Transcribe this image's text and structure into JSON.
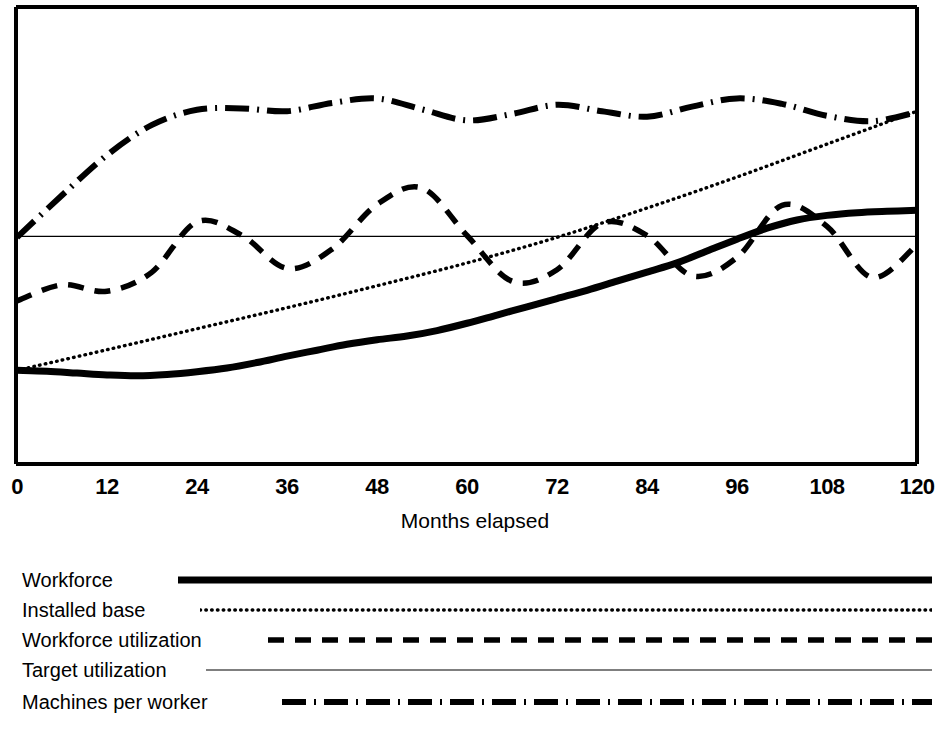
{
  "chart_data": {
    "type": "line",
    "title": "",
    "xlabel": "Months elapsed",
    "ylabel": "",
    "xlim": [
      0,
      120
    ],
    "ylim": [
      0,
      1
    ],
    "grid": false,
    "legend_position": "below",
    "x_ticks": [
      "0",
      "12",
      "24",
      "36",
      "48",
      "60",
      "72",
      "84",
      "96",
      "108",
      "120"
    ],
    "x_tick_values": [
      0,
      12,
      24,
      36,
      48,
      60,
      72,
      84,
      96,
      108,
      120
    ],
    "y_axis_labeled": false,
    "series": [
      {
        "name": "Workforce",
        "style": "thick-solid",
        "x": [
          0,
          4,
          8,
          12,
          16,
          20,
          24,
          28,
          32,
          36,
          40,
          44,
          48,
          52,
          56,
          60,
          64,
          68,
          72,
          76,
          80,
          84,
          88,
          92,
          96,
          100,
          104,
          108,
          112,
          116,
          120
        ],
        "values": [
          0.205,
          0.203,
          0.199,
          0.195,
          0.193,
          0.196,
          0.202,
          0.21,
          0.222,
          0.236,
          0.249,
          0.262,
          0.272,
          0.28,
          0.292,
          0.308,
          0.326,
          0.344,
          0.362,
          0.38,
          0.4,
          0.42,
          0.44,
          0.466,
          0.492,
          0.516,
          0.534,
          0.544,
          0.55,
          0.553,
          0.555
        ]
      },
      {
        "name": "Installed base",
        "style": "dotted",
        "x": [
          0,
          12,
          24,
          36,
          48,
          60,
          72,
          84,
          96,
          108,
          120
        ],
        "values": [
          0.205,
          0.25,
          0.296,
          0.342,
          0.39,
          0.44,
          0.496,
          0.56,
          0.628,
          0.7,
          0.772
        ]
      },
      {
        "name": "Workforce utilization",
        "style": "dashed",
        "x": [
          0,
          6,
          12,
          18,
          24,
          30,
          36,
          42,
          48,
          54,
          60,
          66,
          72,
          78,
          84,
          90,
          96,
          102,
          108,
          114,
          120
        ],
        "values": [
          0.357,
          0.392,
          0.378,
          0.42,
          0.53,
          0.5,
          0.428,
          0.47,
          0.568,
          0.604,
          0.5,
          0.4,
          0.425,
          0.527,
          0.5,
          0.412,
          0.452,
          0.566,
          0.52,
          0.408,
          0.48
        ]
      },
      {
        "name": "Target utilization",
        "style": "thin-solid",
        "x": [
          0,
          120
        ],
        "values": [
          0.498,
          0.498
        ]
      },
      {
        "name": "Machines per worker",
        "style": "dash-dot",
        "x": [
          0,
          6,
          12,
          18,
          24,
          30,
          36,
          42,
          48,
          54,
          60,
          66,
          72,
          78,
          84,
          90,
          96,
          102,
          108,
          114,
          120
        ],
        "values": [
          0.496,
          0.588,
          0.676,
          0.742,
          0.775,
          0.778,
          0.772,
          0.79,
          0.8,
          0.776,
          0.752,
          0.766,
          0.786,
          0.772,
          0.76,
          0.782,
          0.8,
          0.788,
          0.762,
          0.75,
          0.77
        ]
      }
    ],
    "legend_entries": [
      {
        "label": "Workforce",
        "style": "thick-solid"
      },
      {
        "label": "Installed base",
        "style": "dotted"
      },
      {
        "label": "Workforce utilization",
        "style": "dashed"
      },
      {
        "label": "Target utilization",
        "style": "thin-solid"
      },
      {
        "label": "Machines per worker",
        "style": "dash-dot"
      }
    ],
    "colors": {
      "line": "#000000",
      "frame": "#000000",
      "background": "#ffffff"
    }
  }
}
